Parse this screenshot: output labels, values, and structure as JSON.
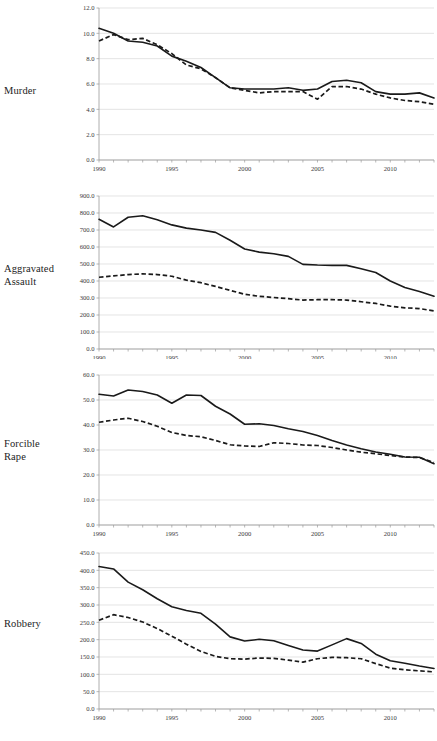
{
  "figure": {
    "ghost_title": "",
    "background": "#ffffff",
    "line_color": "#1a1a1a",
    "grid_color": "#d9d9d9",
    "axis_color": "#9a9a9a"
  },
  "panels": [
    {
      "label": "Murder",
      "label_lines": [
        "Murder"
      ],
      "name": "panel-murder"
    },
    {
      "label": "Aggravated Assault",
      "label_lines": [
        "Aggravated",
        "Assault"
      ],
      "name": "panel-aggravated-assault"
    },
    {
      "label": "Forcible Rape",
      "label_lines": [
        "Forcible",
        "Rape"
      ],
      "name": "panel-forcible-rape"
    },
    {
      "label": "Robbery",
      "label_lines": [
        "Robbery"
      ],
      "name": "panel-robbery"
    }
  ],
  "chart_data": [
    {
      "type": "line",
      "title": "Murder",
      "xlabel": "",
      "ylabel": "",
      "grid": true,
      "legend": "none",
      "xlim": [
        1990,
        2013
      ],
      "ylim": [
        0.0,
        12.0
      ],
      "ytick_labels": [
        "12.0",
        "10.0",
        "8.0",
        "6.0",
        "4.0",
        "2.0",
        "0.0"
      ],
      "ytick_values": [
        12.0,
        10.0,
        8.0,
        6.0,
        4.0,
        2.0,
        0.0
      ],
      "xtick_labels": [
        "1990",
        "1995",
        "2000",
        "2005",
        "2010"
      ],
      "xtick_values": [
        1990,
        1995,
        2000,
        2005,
        2010
      ],
      "x": [
        1990,
        1991,
        1992,
        1993,
        1994,
        1995,
        1996,
        1997,
        1998,
        1999,
        2000,
        2001,
        2002,
        2003,
        2004,
        2005,
        2006,
        2007,
        2008,
        2009,
        2010,
        2011,
        2012,
        2013
      ],
      "series": [
        {
          "name": "solid",
          "style": "solid",
          "values": [
            10.4,
            10.0,
            9.4,
            9.3,
            9.0,
            8.2,
            7.8,
            7.3,
            6.5,
            5.7,
            5.6,
            5.6,
            5.6,
            5.7,
            5.5,
            5.6,
            6.2,
            6.3,
            6.1,
            5.4,
            5.2,
            5.2,
            5.3,
            4.9
          ]
        },
        {
          "name": "dashed",
          "style": "dashed",
          "values": [
            9.4,
            9.9,
            9.5,
            9.6,
            9.1,
            8.4,
            7.5,
            7.2,
            6.5,
            5.7,
            5.5,
            5.3,
            5.4,
            5.4,
            5.4,
            4.8,
            5.8,
            5.8,
            5.6,
            5.2,
            4.9,
            4.7,
            4.6,
            4.4
          ]
        }
      ]
    },
    {
      "type": "line",
      "title": "Aggravated Assault",
      "xlabel": "",
      "ylabel": "",
      "grid": true,
      "legend": "none",
      "xlim": [
        1990,
        2013
      ],
      "ylim": [
        0.0,
        900.0
      ],
      "ytick_labels": [
        "900.0",
        "800.0",
        "700.0",
        "600.0",
        "500.0",
        "400.0",
        "300.0",
        "200.0",
        "100.0",
        "0.0"
      ],
      "ytick_values": [
        900,
        800,
        700,
        600,
        500,
        400,
        300,
        200,
        100,
        0
      ],
      "xtick_labels": [
        "1990",
        "1995",
        "2000",
        "2005",
        "2010"
      ],
      "xtick_values": [
        1990,
        1995,
        2000,
        2005,
        2010
      ],
      "x": [
        1990,
        1991,
        1992,
        1993,
        1994,
        1995,
        1996,
        1997,
        1998,
        1999,
        2000,
        2001,
        2002,
        2003,
        2004,
        2005,
        2006,
        2007,
        2008,
        2009,
        2010,
        2011,
        2012,
        2013
      ],
      "series": [
        {
          "name": "solid",
          "style": "solid",
          "values": [
            763,
            718,
            775,
            784,
            760,
            730,
            711,
            700,
            686,
            640,
            588,
            570,
            560,
            545,
            498,
            494,
            492,
            492,
            472,
            450,
            400,
            362,
            338,
            310
          ]
        },
        {
          "name": "dashed",
          "style": "dashed",
          "values": [
            422,
            430,
            438,
            442,
            438,
            428,
            405,
            390,
            368,
            345,
            322,
            310,
            303,
            296,
            288,
            290,
            290,
            288,
            278,
            268,
            252,
            242,
            238,
            224
          ]
        }
      ]
    },
    {
      "type": "line",
      "title": "Forcible Rape",
      "xlabel": "",
      "ylabel": "",
      "grid": true,
      "legend": "none",
      "xlim": [
        1990,
        2013
      ],
      "ylim": [
        0.0,
        60.0
      ],
      "ytick_labels": [
        "60.0",
        "50.0",
        "40.0",
        "30.0",
        "20.0",
        "10.0",
        "0.0"
      ],
      "ytick_values": [
        60,
        50,
        40,
        30,
        20,
        10,
        0
      ],
      "xtick_labels": [
        "1990",
        "1995",
        "2000",
        "2005",
        "2010"
      ],
      "xtick_values": [
        1990,
        1995,
        2000,
        2005,
        2010
      ],
      "x": [
        1990,
        1991,
        1992,
        1993,
        1994,
        1995,
        1996,
        1997,
        1998,
        1999,
        2000,
        2001,
        2002,
        2003,
        2004,
        2005,
        2006,
        2007,
        2008,
        2009,
        2010,
        2011,
        2012,
        2013
      ],
      "series": [
        {
          "name": "solid",
          "style": "solid",
          "values": [
            52.3,
            51.6,
            54.0,
            53.4,
            52.0,
            48.7,
            52.0,
            51.8,
            47.5,
            44.4,
            40.3,
            40.5,
            39.8,
            38.5,
            37.4,
            35.8,
            33.8,
            32.0,
            30.5,
            29.2,
            28.3,
            27.2,
            27.1,
            24.5
          ]
        },
        {
          "name": "dashed",
          "style": "dashed",
          "values": [
            41.1,
            42.0,
            42.7,
            41.4,
            39.5,
            37.0,
            35.8,
            35.3,
            33.8,
            32.1,
            31.6,
            31.4,
            32.9,
            32.6,
            32.0,
            31.8,
            31.0,
            30.0,
            29.1,
            28.5,
            27.8,
            27.2,
            27.0,
            25.0
          ]
        }
      ]
    },
    {
      "type": "line",
      "title": "Robbery",
      "xlabel": "",
      "ylabel": "",
      "grid": true,
      "legend": "none",
      "xlim": [
        1990,
        2013
      ],
      "ylim": [
        0.0,
        450.0
      ],
      "ytick_labels": [
        "450.0",
        "400.0",
        "350.0",
        "300.0",
        "250.0",
        "200.0",
        "150.0",
        "100.0",
        "50.0",
        "0.0"
      ],
      "ytick_values": [
        450,
        400,
        350,
        300,
        250,
        200,
        150,
        100,
        50,
        0
      ],
      "xtick_labels": [
        "1990",
        "1995",
        "2000",
        "2005",
        "2010"
      ],
      "xtick_values": [
        1990,
        1995,
        2000,
        2005,
        2010
      ],
      "x": [
        1990,
        1991,
        1992,
        1993,
        1994,
        1995,
        1996,
        1997,
        1998,
        1999,
        2000,
        2001,
        2002,
        2003,
        2004,
        2005,
        2006,
        2007,
        2008,
        2009,
        2010,
        2011,
        2012,
        2013
      ],
      "series": [
        {
          "name": "solid",
          "style": "solid",
          "values": [
            411,
            404,
            366,
            344,
            318,
            295,
            284,
            276,
            245,
            208,
            196,
            201,
            197,
            183,
            170,
            167,
            185,
            203,
            189,
            158,
            139,
            132,
            124,
            117
          ]
        },
        {
          "name": "dashed",
          "style": "dashed",
          "values": [
            256,
            272,
            264,
            251,
            232,
            210,
            187,
            166,
            152,
            145,
            144,
            147,
            146,
            141,
            135,
            145,
            149,
            148,
            145,
            131,
            118,
            113,
            110,
            107
          ]
        }
      ]
    }
  ]
}
